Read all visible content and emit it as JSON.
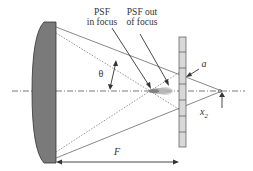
{
  "labels": {
    "psf_in_focus_line1": "PSF",
    "psf_in_focus_line2": "in focus",
    "psf_out_focus_line1": "PSF out",
    "psf_out_focus_line2": "of focus",
    "theta": "θ",
    "a": "a",
    "x2": "x",
    "x2_sub": "2",
    "focal_length": "F"
  },
  "colors": {
    "lens_fill": "#7a7a7a",
    "line": "#444444",
    "detector_fill": "#d8d8d8"
  }
}
